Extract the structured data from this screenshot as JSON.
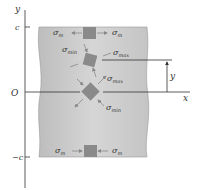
{
  "diagram": {
    "axes": {
      "y_label": "y",
      "x_label": "x",
      "origin_label": "O",
      "top_mark": "c",
      "bottom_mark": "−c",
      "height_label": "y"
    },
    "elements": [
      {
        "id": "top",
        "position": "y = c",
        "orientation": "axial",
        "left_label": "σ",
        "left_sub": "m",
        "right_label": "σ",
        "right_sub": "m",
        "arrows": "outward"
      },
      {
        "id": "upper-mid",
        "position": "y",
        "orientation": "rotated",
        "left_label": "σ",
        "left_sub": "min",
        "right_label": "σ",
        "right_sub": "max"
      },
      {
        "id": "neutral",
        "position": "y = 0",
        "orientation": "45°",
        "left_label": "σ",
        "left_sub": "max",
        "right_label": "σ",
        "right_sub": "min"
      },
      {
        "id": "bottom",
        "position": "y = −c",
        "orientation": "axial",
        "left_label": "σ",
        "left_sub": "m",
        "right_label": "σ",
        "right_sub": "m",
        "arrows": "inward"
      }
    ],
    "colors": {
      "beam_fill": "#c8c8c8",
      "element_fill": "#8a8a8a",
      "line": "#333333",
      "arrow": "#888888"
    }
  }
}
